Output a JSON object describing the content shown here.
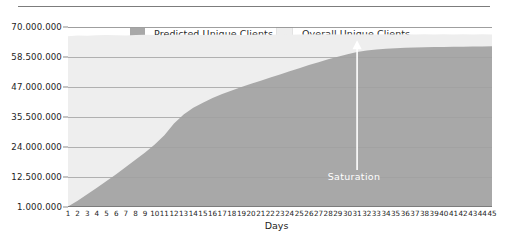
{
  "chart_data": {
    "type": "area",
    "title": "",
    "subtitle": "",
    "xlabel": "Days",
    "ylabel": "",
    "grid": true,
    "legend_position": "top-center",
    "x": [
      1,
      2,
      3,
      4,
      5,
      6,
      7,
      8,
      9,
      10,
      11,
      12,
      13,
      14,
      15,
      16,
      17,
      18,
      19,
      20,
      21,
      22,
      23,
      24,
      25,
      26,
      27,
      28,
      29,
      30,
      31,
      32,
      33,
      34,
      35,
      36,
      37,
      38,
      39,
      40,
      41,
      42,
      43,
      44,
      45
    ],
    "xtick_labels": [
      "1",
      "2",
      "3",
      "4",
      "5",
      "6",
      "7",
      "8",
      "9",
      "10",
      "11",
      "12",
      "13",
      "14",
      "15",
      "16",
      "17",
      "18",
      "19",
      "20",
      "21",
      "22",
      "23",
      "24",
      "25",
      "26",
      "27",
      "28",
      "29",
      "30",
      "31",
      "32",
      "33",
      "34",
      "35",
      "36",
      "37",
      "38",
      "39",
      "40",
      "41",
      "42",
      "43",
      "44",
      "45"
    ],
    "ytick_labels": [
      "70.000.000",
      "58.500.000",
      "47.000.000",
      "35.500.000",
      "24.000.000",
      "12.500.000",
      "1.000.000"
    ],
    "ytick_values": [
      70000000,
      58500000,
      47000000,
      35500000,
      24000000,
      12500000,
      1000000
    ],
    "ylim": [
      1000000,
      70000000
    ],
    "xlim": [
      1,
      45
    ],
    "series": [
      {
        "name": "Overall Unique Clients",
        "color": "#eeeeee",
        "values": [
          66500000,
          66700000,
          66600000,
          66800000,
          66900000,
          66800000,
          66700000,
          66900000,
          67000000,
          66900000,
          66800000,
          67000000,
          67100000,
          67000000,
          66900000,
          67000000,
          67100000,
          67000000,
          66900000,
          67000000,
          67100000,
          67000000,
          67100000,
          67000000,
          67100000,
          67200000,
          67100000,
          67200000,
          67100000,
          67200000,
          67100000,
          67200000,
          67100000,
          67200000,
          67100000,
          67200000,
          67100000,
          67200000,
          67100000,
          67200000,
          67100000,
          67200000,
          67100000,
          67200000,
          67100000
        ]
      },
      {
        "name": "Predicted Unique Clients",
        "color": "#a8a8a8",
        "values": [
          1200000,
          3400000,
          5900000,
          8400000,
          11000000,
          13600000,
          16300000,
          19100000,
          21900000,
          25000000,
          28500000,
          33000000,
          36500000,
          39000000,
          41000000,
          42800000,
          44300000,
          45700000,
          47000000,
          48200000,
          49400000,
          50600000,
          51800000,
          53000000,
          54200000,
          55400000,
          56500000,
          57600000,
          58600000,
          59600000,
          60400000,
          61000000,
          61400000,
          61700000,
          61900000,
          62000000,
          62100000,
          62200000,
          62300000,
          62300000,
          62400000,
          62400000,
          62500000,
          62500000,
          62600000
        ]
      }
    ],
    "annotations": [
      {
        "name": "saturation-arrow",
        "text": "Saturation",
        "x_day": 31,
        "arrow_direction": "up",
        "color": "#ffffff"
      }
    ]
  },
  "legend": {
    "items": [
      {
        "label": "Predicted Unique Clients",
        "color": "#a8a8a8",
        "key": "predicted"
      },
      {
        "label": "Overall Unique Clients",
        "color": "#eeeeee",
        "key": "overall"
      }
    ]
  },
  "axes": {
    "x_title": "Days"
  },
  "colors": {
    "predicted_fill": "#a8a8a8",
    "overall_fill": "#eeeeee",
    "gridline": "#8e8e8e",
    "axis_line": "#7c7c7c",
    "text": "#1d1d1d",
    "annotation": "#ffffff",
    "background": "#ffffff"
  }
}
